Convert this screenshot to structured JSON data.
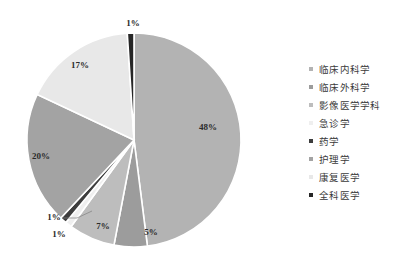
{
  "chart_data": {
    "type": "pie",
    "title": "",
    "legend_position": "right",
    "labels": [
      "临床内科学",
      "临床外科学",
      "影像医学学科",
      "急诊学",
      "药学",
      "护理学",
      "康复医学",
      "全科医学"
    ],
    "values": [
      48,
      5,
      7,
      1,
      1,
      20,
      17,
      1
    ],
    "value_labels": [
      "48%",
      "5%",
      "7%",
      "1%",
      "1%",
      "20%",
      "17%",
      "1%"
    ],
    "colors": [
      "#b3b3b3",
      "#9c9c9c",
      "#bdbdbd",
      "#efefef",
      "#3d3d3d",
      "#a3a3a3",
      "#e8e8e8",
      "#262626"
    ],
    "units": "percent",
    "start_angle_deg": 0,
    "direction": "clockwise"
  },
  "legend": {
    "items": [
      {
        "label": "临床内科学",
        "color": "#b3b3b3"
      },
      {
        "label": "临床外科学",
        "color": "#9c9c9c"
      },
      {
        "label": "影像医学学科",
        "color": "#bdbdbd"
      },
      {
        "label": "急诊学",
        "color": "#efefef"
      },
      {
        "label": "药学",
        "color": "#3d3d3d"
      },
      {
        "label": "护理学",
        "color": "#a3a3a3"
      },
      {
        "label": "康复医学",
        "color": "#e8e8e8"
      },
      {
        "label": "全科医学",
        "color": "#262626"
      }
    ]
  },
  "slice_labels": {
    "s0": "48%",
    "s1": "5%",
    "s2": "7%",
    "s3": "1%",
    "s4": "1%",
    "s5": "20%",
    "s6": "17%",
    "s7": "1%"
  }
}
